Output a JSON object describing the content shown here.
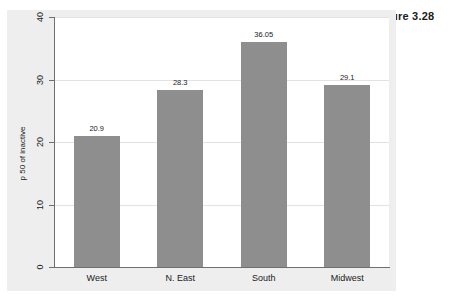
{
  "figure": {
    "caption": "Figure 3.28"
  },
  "chart_data": {
    "type": "bar",
    "title": "",
    "xlabel": "",
    "ylabel": "p 50 of inactive",
    "categories": [
      "West",
      "N. East",
      "South",
      "Midwest"
    ],
    "values": [
      20.9,
      28.3,
      36.05,
      29.1
    ],
    "value_labels": [
      "20.9",
      "28.3",
      "36.05",
      "29.1"
    ],
    "ylim": [
      0,
      40
    ],
    "yticks": [
      0,
      10,
      20,
      30,
      40
    ],
    "ytick_labels": [
      "0",
      "10",
      "20",
      "30",
      "40"
    ],
    "grid": true,
    "legend": false,
    "bar_color": "#8e8e8e",
    "panel_color": "#eeeeee",
    "plot_color": "#ffffff",
    "axis_color": "#6f6f6f",
    "gridline_color": "#e2e2e2"
  }
}
